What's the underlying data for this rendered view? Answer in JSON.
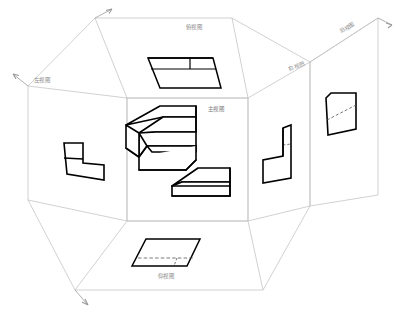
{
  "drawing": {
    "title": "三视图投影展开图",
    "type": "orthographic-projection-unfolded-box",
    "background_color": "#ffffff",
    "plane_line_color": "#b8b8b8",
    "object_line_color": "#000000",
    "hidden_line_color": "#555555",
    "label_color": "#8a8a8a"
  },
  "labels": {
    "top": "俯视图",
    "left": "左视图",
    "front": "主视图",
    "right": "右视图",
    "rear": "后视图",
    "bottom": "仰视图"
  },
  "label_positions": {
    "top": {
      "x": 186,
      "y": 28
    },
    "left": {
      "x": 34,
      "y": 81
    },
    "front": {
      "x": 208,
      "y": 110
    },
    "right": {
      "x": 290,
      "y": 70
    },
    "rear": {
      "x": 340,
      "y": 33
    },
    "bottom": {
      "x": 158,
      "y": 277
    }
  },
  "views": [
    {
      "name": "top-view",
      "label": "俯视图",
      "shape": "parallelogram-with-two-internal-lines",
      "has_hidden_lines": false
    },
    {
      "name": "left-view",
      "label": "左视图",
      "shape": "L-stepped-profile",
      "has_hidden_lines": false
    },
    {
      "name": "front-view",
      "label": "主视图",
      "shape": "isometric-solid",
      "has_hidden_lines": false
    },
    {
      "name": "right-view",
      "label": "右视图",
      "shape": "mirrored-L-stepped-profile",
      "has_hidden_lines": true
    },
    {
      "name": "rear-view",
      "label": "后视图",
      "shape": "quadrilateral-with-diagonal",
      "has_hidden_lines": true
    },
    {
      "name": "bottom-view",
      "label": "仰视图",
      "shape": "parallelogram-with-hidden-lines",
      "has_hidden_lines": true
    }
  ],
  "arrows": {
    "count": 4,
    "names": [
      "fold-arrow-top",
      "fold-arrow-left",
      "fold-arrow-bottom",
      "fold-arrow-right"
    ]
  }
}
